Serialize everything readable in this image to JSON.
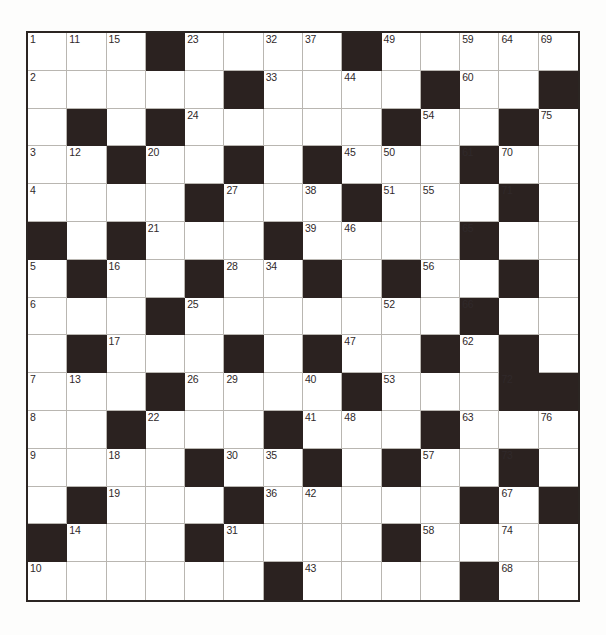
{
  "puzzle": {
    "type": "crossword-grid",
    "rows": 15,
    "cols": 14,
    "colors": {
      "page_background": "#fdfdfc",
      "cell_background": "#ffffff",
      "block_color": "#2b2220",
      "outer_border": "#2b2522",
      "inner_grid_line": "#b9b6b1",
      "number_color": "#30292a"
    },
    "black_squares": {
      "1": [
        4,
        9
      ],
      "2": [
        6,
        11,
        14
      ],
      "3": [
        2,
        4,
        10,
        13
      ],
      "4": [
        3,
        6,
        8,
        12
      ],
      "5": [
        5,
        9,
        13
      ],
      "6": [
        1,
        3,
        7,
        12
      ],
      "7": [
        2,
        5,
        8,
        10,
        13
      ],
      "8": [
        4,
        12
      ],
      "9": [
        2,
        6,
        8,
        11,
        13
      ],
      "10": [
        4,
        9,
        13,
        14
      ],
      "11": [
        3,
        7,
        11
      ],
      "12": [
        5,
        8,
        10,
        13
      ],
      "13": [
        2,
        6,
        12,
        14
      ],
      "14": [
        1,
        5,
        10
      ],
      "15": [
        7,
        12
      ]
    },
    "numbers": {
      "1-1": "1",
      "1-2": "11",
      "1-3": "15",
      "1-5": "23",
      "1-7": "32",
      "1-8": "37",
      "1-10": "49",
      "1-12": "59",
      "1-13": "64",
      "1-14": "69",
      "2-1": "2",
      "2-7": "33",
      "2-9": "44",
      "2-12": "60",
      "3-5": "24",
      "3-11": "54",
      "3-14": "75",
      "4-1": "3",
      "4-2": "12",
      "4-4": "20",
      "4-9": "45",
      "4-10": "50",
      "4-12": "61",
      "4-13": "70",
      "5-1": "4",
      "5-6": "27",
      "5-8": "38",
      "5-10": "51",
      "5-11": "55",
      "5-13": "71",
      "6-4": "21",
      "6-8": "39",
      "6-9": "46",
      "6-12": "65",
      "7-1": "5",
      "7-3": "16",
      "7-6": "28",
      "7-7": "34",
      "7-11": "56",
      "8-1": "6",
      "8-5": "25",
      "8-10": "52",
      "8-12": "66",
      "9-3": "17",
      "9-9": "47",
      "9-12": "62",
      "10-1": "7",
      "10-2": "13",
      "10-5": "26",
      "10-6": "29",
      "10-8": "40",
      "10-10": "53",
      "10-13": "72",
      "11-1": "8",
      "11-4": "22",
      "11-8": "41",
      "11-9": "48",
      "11-12": "63",
      "11-14": "76",
      "12-1": "9",
      "12-3": "18",
      "12-6": "30",
      "12-7": "35",
      "12-11": "57",
      "12-13": "73",
      "13-3": "19",
      "13-7": "36",
      "13-8": "42",
      "13-13": "67",
      "14-2": "14",
      "14-6": "31",
      "14-11": "58",
      "14-13": "74",
      "15-1": "10",
      "15-8": "43",
      "15-13": "68"
    }
  }
}
